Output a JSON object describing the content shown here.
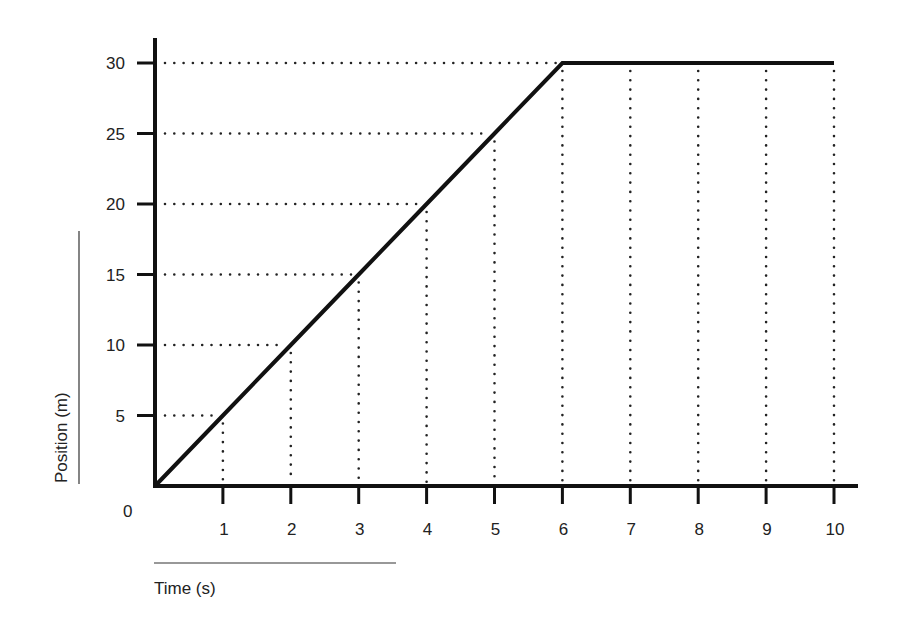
{
  "chart_data": {
    "type": "line",
    "title": "",
    "xlabel": "Time (s)",
    "ylabel": "Position (m)",
    "x": [
      0,
      1,
      2,
      3,
      4,
      5,
      6,
      7,
      8,
      9,
      10
    ],
    "series": [
      {
        "name": "Position",
        "values": [
          0,
          5,
          10,
          15,
          20,
          25,
          30,
          30,
          30,
          30,
          30
        ]
      }
    ],
    "xlim": [
      0,
      10
    ],
    "ylim": [
      0,
      30
    ],
    "x_ticks": [
      "1",
      "2",
      "3",
      "4",
      "5",
      "6",
      "7",
      "8",
      "9",
      "10"
    ],
    "y_ticks": [
      "5",
      "10",
      "15",
      "20",
      "25",
      "30"
    ],
    "origin_label": "0",
    "grid": "dotted drop-lines from each data point to both axes",
    "legend": "none",
    "colors": {
      "line": "#111111",
      "axis": "#111111",
      "grid": "#222222",
      "background": "#ffffff"
    }
  }
}
